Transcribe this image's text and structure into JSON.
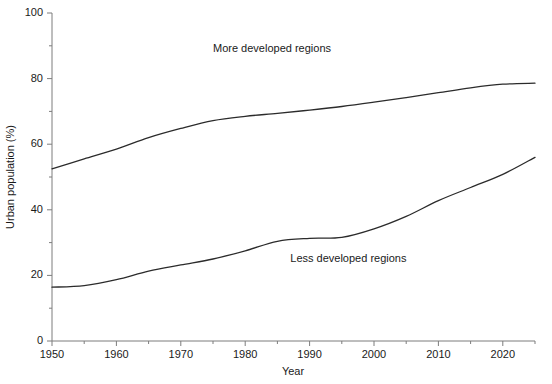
{
  "chart_data": {
    "type": "line",
    "title": "",
    "xlabel": "Year",
    "ylabel": "Urban population (%)",
    "xlim": [
      1950,
      2025
    ],
    "ylim": [
      0,
      100
    ],
    "grid": false,
    "legend_position": "inline-annotations",
    "x_ticks": [
      1950,
      1960,
      1970,
      1980,
      1990,
      2000,
      2010,
      2020
    ],
    "x_tick_labels": [
      "1950",
      "1960",
      "1970",
      "1980",
      "1990",
      "2000",
      "2010",
      "2020"
    ],
    "x_minor_ticks": [
      1955,
      1965,
      1975,
      1985,
      1995,
      2005,
      2015,
      2025
    ],
    "y_ticks": [
      0,
      20,
      40,
      60,
      80,
      100
    ],
    "y_tick_labels": [
      "0",
      "20",
      "40",
      "60",
      "80",
      "100"
    ],
    "y_minor_ticks": [
      10,
      30,
      50,
      70,
      90
    ],
    "x": [
      1950,
      1955,
      1960,
      1965,
      1970,
      1975,
      1980,
      1985,
      1990,
      1995,
      2000,
      2005,
      2010,
      2015,
      2020,
      2025
    ],
    "series": [
      {
        "name": "More developed regions",
        "label_x": 1975,
        "label_y": 88,
        "color": "#2b2b2b",
        "values": [
          52.5,
          55.5,
          58.5,
          62.0,
          64.8,
          67.2,
          68.5,
          69.4,
          70.4,
          71.5,
          72.8,
          74.2,
          75.7,
          77.2,
          78.3,
          78.6
        ]
      },
      {
        "name": "Less developed regions",
        "label_x": 1987,
        "label_y": 24,
        "color": "#2b2b2b",
        "values": [
          16.4,
          16.9,
          18.7,
          21.3,
          23.2,
          25.0,
          27.5,
          30.4,
          31.3,
          31.6,
          34.2,
          38.0,
          42.8,
          46.8,
          50.8,
          56.0
        ]
      }
    ]
  }
}
